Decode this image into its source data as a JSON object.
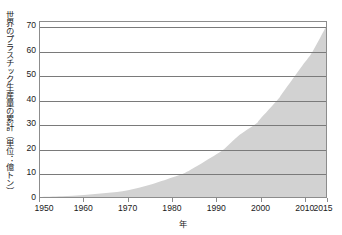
{
  "chart_data": {
    "type": "area",
    "title": "",
    "subtitle": "",
    "xlabel": "年",
    "ylabel": "世界のプラスチック生産量の累計（単位：億トン）",
    "xlim": [
      1950,
      2015
    ],
    "ylim": [
      0,
      72
    ],
    "grid": "horizontal",
    "legend": "none",
    "x_tick_labels": [
      "1950",
      "1960",
      "1970",
      "1980",
      "1990",
      "2000",
      "2010",
      "2015"
    ],
    "x_tick_values": [
      1950,
      1960,
      1970,
      1980,
      1990,
      2000,
      2010,
      2015
    ],
    "y_tick_labels": [
      "0",
      "10",
      "20",
      "30",
      "40",
      "50",
      "60",
      "70"
    ],
    "y_tick_values": [
      0,
      10,
      20,
      30,
      40,
      50,
      60,
      70
    ],
    "series": [
      {
        "name": "世界のプラスチック生産量の累計",
        "fill_color": "#d2d2d2",
        "x": [
          1950,
          1955,
          1960,
          1965,
          1970,
          1975,
          1980,
          1983,
          1985,
          1990,
          1992,
          1995,
          1999,
          2000,
          2004,
          2005,
          2008,
          2010,
          2012,
          2015
        ],
        "values": [
          0,
          0.3,
          0.8,
          1.6,
          2.8,
          5.0,
          8.0,
          10.0,
          12.0,
          17.5,
          20.0,
          25.0,
          30.0,
          32.0,
          40.0,
          42.5,
          50.0,
          55.0,
          60.0,
          70.0
        ]
      }
    ],
    "annotations": []
  },
  "axes": {
    "y_title": "世界のプラスチック生産量の累計（単位：億トン）",
    "x_title": "年"
  },
  "style": {
    "background": "#ffffff",
    "frame_color": "#8c8c8c",
    "gridline_color": "#7a7a7a",
    "area_color": "#d2d2d2",
    "text_color": "#1a1a1a"
  }
}
